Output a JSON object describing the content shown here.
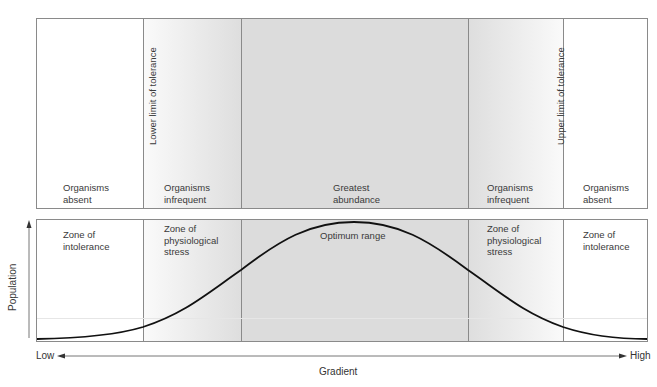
{
  "top_panel": {
    "zones": [
      {
        "label": "Organisms\nabsent"
      },
      {
        "label": "Organisms\ninfrequent"
      },
      {
        "label": "Greatest\nabundance"
      },
      {
        "label": "Organisms\ninfrequent"
      },
      {
        "label": "Organisms\nabsent"
      }
    ],
    "limits": {
      "lower": "Lower limit of tolerance",
      "upper": "Upper limit of tolerance"
    }
  },
  "bottom_panel": {
    "zones": [
      {
        "label": "Zone of\nintolerance"
      },
      {
        "label": "Zone of\nphysiological\nstress"
      },
      {
        "label": "Optimum range"
      },
      {
        "label": "Zone of\nphysiological\nstress"
      },
      {
        "label": "Zone of\nintolerance"
      }
    ]
  },
  "axes": {
    "y_label": "Population",
    "x_label": "Gradient",
    "x_low": "Low",
    "x_high": "High"
  },
  "colors": {
    "border": "#8a8a8a",
    "shade": "#d9d9d9",
    "curve": "#111111"
  }
}
